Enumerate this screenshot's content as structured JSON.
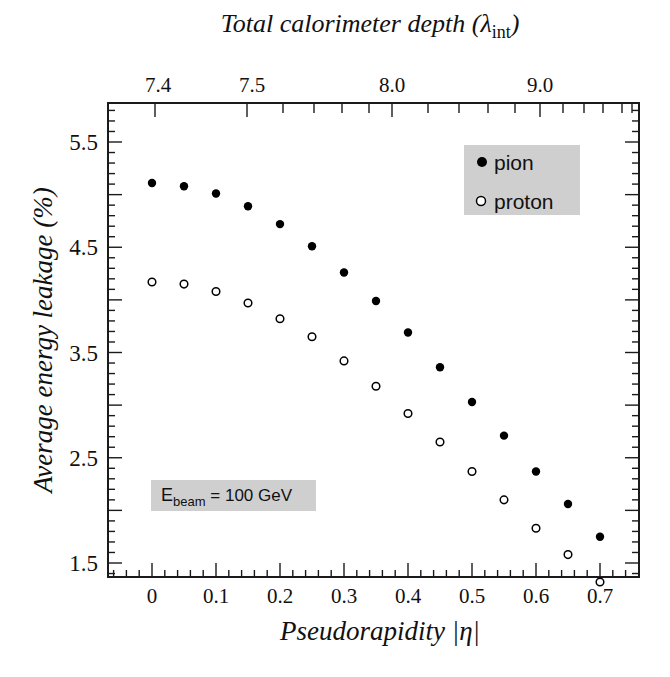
{
  "chart_data": {
    "type": "scatter",
    "title": "",
    "xlabel": "Pseudorapidity |η|",
    "ylabel": "Average energy leakage (%)",
    "top_xlabel_main": "Total calorimeter depth (λ",
    "top_xlabel_sub": "int",
    "top_xlabel_close": ")",
    "xlim": [
      -0.07,
      0.76
    ],
    "ylim": [
      1.2,
      5.87
    ],
    "x_ticks": [
      0,
      0.1,
      0.2,
      0.3,
      0.4,
      0.5,
      0.6,
      0.7
    ],
    "x_tick_labels": [
      "0",
      "0.1",
      "0.2",
      "0.3",
      "0.4",
      "0.5",
      "0.6",
      "0.7"
    ],
    "y_ticks": [
      1.5,
      2.5,
      3.5,
      4.5,
      5.5
    ],
    "y_tick_labels": [
      "1.5",
      "2.5",
      "3.5",
      "4.5",
      "5.5"
    ],
    "top_ticks": [
      {
        "label": "7.4",
        "eta": 0.005
      },
      {
        "label": "7.5",
        "eta": 0.149
      },
      {
        "label": "8.0",
        "eta": 0.376
      },
      {
        "label": "9.0",
        "eta": 0.605
      }
    ],
    "grid": false,
    "legend_position": "upper right",
    "x": [
      0,
      0.05,
      0.1,
      0.15,
      0.2,
      0.25,
      0.3,
      0.35,
      0.4,
      0.45,
      0.5,
      0.55,
      0.6,
      0.65,
      0.7
    ],
    "series": [
      {
        "name": "pion",
        "marker": "filled-circle",
        "values": [
          5.11,
          5.08,
          5.01,
          4.89,
          4.72,
          4.51,
          4.26,
          3.99,
          3.69,
          3.36,
          3.03,
          2.71,
          2.37,
          2.06,
          1.75
        ]
      },
      {
        "name": "proton",
        "marker": "open-circle",
        "values": [
          4.17,
          4.15,
          4.08,
          3.97,
          3.82,
          3.65,
          3.42,
          3.18,
          2.92,
          2.65,
          2.37,
          2.1,
          1.83,
          1.58,
          1.32
        ]
      }
    ],
    "annotations": [
      {
        "text_main": "E",
        "text_sub": "beam",
        "text_rest": " = 100 GeV"
      }
    ]
  },
  "legend": {
    "items": [
      {
        "label": "pion"
      },
      {
        "label": "proton"
      }
    ]
  },
  "colors": {
    "marker": "#000000",
    "legend_box": "#cfcfcf",
    "annotation_box": "#cfcfcf",
    "axis": "#1a1a1a"
  }
}
